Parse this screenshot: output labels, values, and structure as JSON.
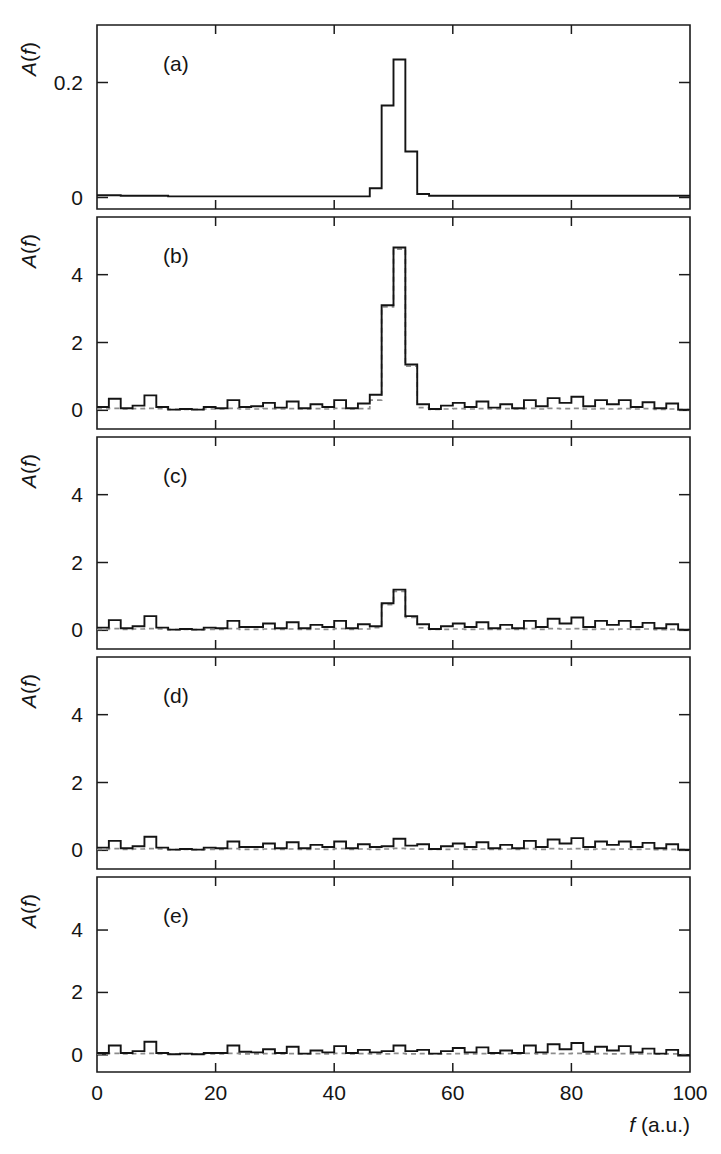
{
  "figure": {
    "xlabel_italic": "f",
    "xlabel_rest": " (a.u.)",
    "ylabel_italic": "A",
    "ylabel_rest": "(f)",
    "background_color": "#ffffff",
    "solid_color": "#141414",
    "dashed_color": "#8d8d8d"
  },
  "chart_data": [
    {
      "type": "line",
      "panel": "(a)",
      "title": "",
      "xlabel": "f (a.u.)",
      "ylabel": "A(f)",
      "xlim": [
        0,
        100
      ],
      "ylim": [
        -0.02,
        0.3
      ],
      "xticks": [
        0,
        20,
        40,
        60,
        80,
        100
      ],
      "yticks": [
        0,
        0.2
      ],
      "ytick_labels": [
        "0",
        "0.2"
      ],
      "grid": false,
      "legend": "none",
      "drawstyle": "steps-post",
      "bin_width": 2,
      "series": [
        {
          "name": "solid",
          "style": "solid",
          "x": [
            0,
            2,
            4,
            6,
            8,
            10,
            12,
            14,
            16,
            18,
            20,
            22,
            24,
            26,
            28,
            30,
            32,
            34,
            36,
            38,
            40,
            42,
            44,
            46,
            48,
            50,
            52,
            54,
            56,
            58,
            60,
            62,
            64,
            66,
            68,
            70,
            72,
            74,
            76,
            78,
            80,
            82,
            84,
            86,
            88,
            90,
            92,
            94,
            96,
            98,
            100
          ],
          "values": [
            0.004,
            0.004,
            0.003,
            0.003,
            0.003,
            0.003,
            0.002,
            0.002,
            0.002,
            0.002,
            0.002,
            0.002,
            0.002,
            0.002,
            0.002,
            0.002,
            0.002,
            0.002,
            0.002,
            0.002,
            0.002,
            0.002,
            0.002,
            0.016,
            0.16,
            0.24,
            0.08,
            0.006,
            0.003,
            0.003,
            0.003,
            0.003,
            0.003,
            0.003,
            0.003,
            0.003,
            0.003,
            0.003,
            0.003,
            0.003,
            0.003,
            0.003,
            0.003,
            0.003,
            0.003,
            0.003,
            0.003,
            0.003,
            0.003,
            0.003,
            0.003
          ]
        }
      ]
    },
    {
      "type": "line",
      "panel": "(b)",
      "title": "",
      "xlabel": "f (a.u.)",
      "ylabel": "A(f)",
      "xlim": [
        0,
        100
      ],
      "ylim": [
        -0.55,
        5.7
      ],
      "xticks": [
        0,
        20,
        40,
        60,
        80,
        100
      ],
      "yticks": [
        0,
        2,
        4
      ],
      "ytick_labels": [
        "0",
        "2",
        "4"
      ],
      "grid": false,
      "legend": "none",
      "drawstyle": "steps-post",
      "bin_width": 2,
      "series": [
        {
          "name": "solid",
          "style": "solid",
          "x": [
            0,
            2,
            4,
            6,
            8,
            10,
            12,
            14,
            16,
            18,
            20,
            22,
            24,
            26,
            28,
            30,
            32,
            34,
            36,
            38,
            40,
            42,
            44,
            46,
            48,
            50,
            52,
            54,
            56,
            58,
            60,
            62,
            64,
            66,
            68,
            70,
            72,
            74,
            76,
            78,
            80,
            82,
            84,
            86,
            88,
            90,
            92,
            94,
            96,
            98,
            100
          ],
          "values": [
            0.1,
            0.34,
            0.06,
            0.14,
            0.44,
            0.1,
            0.02,
            0.04,
            0.02,
            0.1,
            0.06,
            0.3,
            0.1,
            0.12,
            0.22,
            0.08,
            0.26,
            0.06,
            0.18,
            0.1,
            0.3,
            0.06,
            0.2,
            0.46,
            3.1,
            4.8,
            1.35,
            0.18,
            0.04,
            0.14,
            0.22,
            0.1,
            0.26,
            0.08,
            0.18,
            0.06,
            0.3,
            0.12,
            0.36,
            0.22,
            0.4,
            0.12,
            0.3,
            0.18,
            0.3,
            0.1,
            0.24,
            0.06,
            0.2,
            0.02,
            0.02
          ]
        },
        {
          "name": "dashed",
          "style": "dashed",
          "x": [
            0,
            2,
            4,
            6,
            8,
            10,
            12,
            14,
            16,
            18,
            20,
            22,
            24,
            26,
            28,
            30,
            32,
            34,
            36,
            38,
            40,
            42,
            44,
            46,
            48,
            50,
            52,
            54,
            56,
            58,
            60,
            62,
            64,
            66,
            68,
            70,
            72,
            74,
            76,
            78,
            80,
            82,
            84,
            86,
            88,
            90,
            92,
            94,
            96,
            98,
            100
          ],
          "values": [
            0.04,
            0.06,
            0.04,
            0.05,
            0.06,
            0.05,
            0.03,
            0.03,
            0.03,
            0.04,
            0.04,
            0.06,
            0.04,
            0.04,
            0.05,
            0.04,
            0.05,
            0.04,
            0.05,
            0.04,
            0.06,
            0.04,
            0.05,
            0.3,
            3.05,
            4.75,
            1.3,
            0.08,
            0.03,
            0.04,
            0.05,
            0.04,
            0.05,
            0.04,
            0.05,
            0.04,
            0.06,
            0.04,
            0.06,
            0.05,
            0.06,
            0.04,
            0.05,
            0.04,
            0.05,
            0.04,
            0.05,
            0.03,
            0.04,
            0.02,
            0.02
          ]
        }
      ]
    },
    {
      "type": "line",
      "panel": "(c)",
      "title": "",
      "xlabel": "f (a.u.)",
      "ylabel": "A(f)",
      "xlim": [
        0,
        100
      ],
      "ylim": [
        -0.55,
        5.7
      ],
      "xticks": [
        0,
        20,
        40,
        60,
        80,
        100
      ],
      "yticks": [
        0,
        2,
        4
      ],
      "ytick_labels": [
        "0",
        "2",
        "4"
      ],
      "grid": false,
      "legend": "none",
      "drawstyle": "steps-post",
      "bin_width": 2,
      "series": [
        {
          "name": "solid",
          "style": "solid",
          "x": [
            0,
            2,
            4,
            6,
            8,
            10,
            12,
            14,
            16,
            18,
            20,
            22,
            24,
            26,
            28,
            30,
            32,
            34,
            36,
            38,
            40,
            42,
            44,
            46,
            48,
            50,
            52,
            54,
            56,
            58,
            60,
            62,
            64,
            66,
            68,
            70,
            72,
            74,
            76,
            78,
            80,
            82,
            84,
            86,
            88,
            90,
            92,
            94,
            96,
            98,
            100
          ],
          "values": [
            0.08,
            0.3,
            0.06,
            0.12,
            0.42,
            0.08,
            0.02,
            0.04,
            0.02,
            0.08,
            0.06,
            0.28,
            0.1,
            0.1,
            0.2,
            0.06,
            0.24,
            0.06,
            0.16,
            0.1,
            0.28,
            0.06,
            0.18,
            0.12,
            0.8,
            1.2,
            0.42,
            0.18,
            0.04,
            0.12,
            0.2,
            0.1,
            0.24,
            0.06,
            0.16,
            0.06,
            0.28,
            0.1,
            0.34,
            0.2,
            0.38,
            0.1,
            0.28,
            0.16,
            0.28,
            0.1,
            0.22,
            0.06,
            0.18,
            0.02,
            0.02
          ]
        },
        {
          "name": "dashed",
          "style": "dashed",
          "x": [
            0,
            2,
            4,
            6,
            8,
            10,
            12,
            14,
            16,
            18,
            20,
            22,
            24,
            26,
            28,
            30,
            32,
            34,
            36,
            38,
            40,
            42,
            44,
            46,
            48,
            50,
            52,
            54,
            56,
            58,
            60,
            62,
            64,
            66,
            68,
            70,
            72,
            74,
            76,
            78,
            80,
            82,
            84,
            86,
            88,
            90,
            92,
            94,
            96,
            98,
            100
          ],
          "values": [
            0.03,
            0.05,
            0.03,
            0.04,
            0.05,
            0.04,
            0.02,
            0.03,
            0.02,
            0.03,
            0.03,
            0.05,
            0.03,
            0.03,
            0.04,
            0.03,
            0.04,
            0.03,
            0.04,
            0.03,
            0.05,
            0.03,
            0.04,
            0.08,
            0.76,
            1.15,
            0.38,
            0.07,
            0.03,
            0.03,
            0.04,
            0.03,
            0.04,
            0.03,
            0.04,
            0.03,
            0.05,
            0.03,
            0.05,
            0.04,
            0.05,
            0.03,
            0.04,
            0.03,
            0.04,
            0.03,
            0.04,
            0.02,
            0.03,
            0.02,
            0.02
          ]
        }
      ]
    },
    {
      "type": "line",
      "panel": "(d)",
      "title": "",
      "xlabel": "f (a.u.)",
      "ylabel": "A(f)",
      "xlim": [
        0,
        100
      ],
      "ylim": [
        -0.55,
        5.7
      ],
      "xticks": [
        0,
        20,
        40,
        60,
        80,
        100
      ],
      "yticks": [
        0,
        2,
        4
      ],
      "ytick_labels": [
        "0",
        "2",
        "4"
      ],
      "grid": false,
      "legend": "none",
      "drawstyle": "steps-post",
      "bin_width": 2,
      "series": [
        {
          "name": "solid",
          "style": "solid",
          "x": [
            0,
            2,
            4,
            6,
            8,
            10,
            12,
            14,
            16,
            18,
            20,
            22,
            24,
            26,
            28,
            30,
            32,
            34,
            36,
            38,
            40,
            42,
            44,
            46,
            48,
            50,
            52,
            54,
            56,
            58,
            60,
            62,
            64,
            66,
            68,
            70,
            72,
            74,
            76,
            78,
            80,
            82,
            84,
            86,
            88,
            90,
            92,
            94,
            96,
            98,
            100
          ],
          "values": [
            0.08,
            0.28,
            0.06,
            0.12,
            0.4,
            0.08,
            0.02,
            0.04,
            0.02,
            0.08,
            0.06,
            0.26,
            0.1,
            0.1,
            0.2,
            0.06,
            0.24,
            0.06,
            0.16,
            0.1,
            0.26,
            0.06,
            0.18,
            0.1,
            0.12,
            0.34,
            0.14,
            0.18,
            0.04,
            0.12,
            0.2,
            0.1,
            0.24,
            0.06,
            0.16,
            0.06,
            0.28,
            0.1,
            0.32,
            0.2,
            0.36,
            0.1,
            0.26,
            0.16,
            0.26,
            0.1,
            0.22,
            0.06,
            0.18,
            0.02,
            0.02
          ]
        },
        {
          "name": "dashed",
          "style": "dashed",
          "x": [
            0,
            2,
            4,
            6,
            8,
            10,
            12,
            14,
            16,
            18,
            20,
            22,
            24,
            26,
            28,
            30,
            32,
            34,
            36,
            38,
            40,
            42,
            44,
            46,
            48,
            50,
            52,
            54,
            56,
            58,
            60,
            62,
            64,
            66,
            68,
            70,
            72,
            74,
            76,
            78,
            80,
            82,
            84,
            86,
            88,
            90,
            92,
            94,
            96,
            98,
            100
          ],
          "values": [
            0.03,
            0.05,
            0.03,
            0.04,
            0.05,
            0.04,
            0.02,
            0.03,
            0.02,
            0.03,
            0.03,
            0.05,
            0.03,
            0.03,
            0.04,
            0.03,
            0.04,
            0.03,
            0.04,
            0.03,
            0.05,
            0.03,
            0.04,
            0.03,
            0.04,
            0.06,
            0.04,
            0.04,
            0.03,
            0.03,
            0.04,
            0.03,
            0.04,
            0.03,
            0.04,
            0.03,
            0.05,
            0.03,
            0.05,
            0.04,
            0.05,
            0.03,
            0.04,
            0.03,
            0.04,
            0.03,
            0.04,
            0.02,
            0.03,
            0.02,
            0.02
          ]
        }
      ]
    },
    {
      "type": "line",
      "panel": "(e)",
      "title": "",
      "xlabel": "f (a.u.)",
      "ylabel": "A(f)",
      "xlim": [
        0,
        100
      ],
      "ylim": [
        -0.55,
        5.7
      ],
      "xticks": [
        0,
        20,
        40,
        60,
        80,
        100
      ],
      "yticks": [
        0,
        2,
        4
      ],
      "ytick_labels": [
        "0",
        "2",
        "4"
      ],
      "grid": false,
      "legend": "none",
      "drawstyle": "steps-post",
      "bin_width": 2,
      "series": [
        {
          "name": "solid",
          "style": "solid",
          "x": [
            0,
            2,
            4,
            6,
            8,
            10,
            12,
            14,
            16,
            18,
            20,
            22,
            24,
            26,
            28,
            30,
            32,
            34,
            36,
            38,
            40,
            42,
            44,
            46,
            48,
            50,
            52,
            54,
            56,
            58,
            60,
            62,
            64,
            66,
            68,
            70,
            72,
            74,
            76,
            78,
            80,
            82,
            84,
            86,
            88,
            90,
            92,
            94,
            96,
            98,
            100
          ],
          "values": [
            0.06,
            0.3,
            0.06,
            0.12,
            0.42,
            0.06,
            0.02,
            0.04,
            0.02,
            0.06,
            0.06,
            0.3,
            0.1,
            0.08,
            0.18,
            0.06,
            0.26,
            0.04,
            0.14,
            0.08,
            0.28,
            0.06,
            0.16,
            0.08,
            0.12,
            0.3,
            0.12,
            0.16,
            0.04,
            0.12,
            0.22,
            0.08,
            0.24,
            0.06,
            0.14,
            0.06,
            0.3,
            0.08,
            0.34,
            0.18,
            0.38,
            0.1,
            0.26,
            0.14,
            0.28,
            0.08,
            0.2,
            0.04,
            0.16,
            -0.02,
            -0.02
          ]
        },
        {
          "name": "dashed",
          "style": "dashed",
          "x": [
            0,
            2,
            4,
            6,
            8,
            10,
            12,
            14,
            16,
            18,
            20,
            22,
            24,
            26,
            28,
            30,
            32,
            34,
            36,
            38,
            40,
            42,
            44,
            46,
            48,
            50,
            52,
            54,
            56,
            58,
            60,
            62,
            64,
            66,
            68,
            70,
            72,
            74,
            76,
            78,
            80,
            82,
            84,
            86,
            88,
            90,
            92,
            94,
            96,
            98,
            100
          ],
          "values": [
            0.03,
            0.05,
            0.03,
            0.04,
            0.05,
            0.03,
            0.02,
            0.03,
            0.02,
            0.03,
            0.03,
            0.05,
            0.03,
            0.03,
            0.04,
            0.03,
            0.04,
            0.03,
            0.04,
            0.03,
            0.05,
            0.03,
            0.04,
            0.03,
            0.03,
            0.05,
            0.03,
            0.04,
            0.03,
            0.03,
            0.04,
            0.03,
            0.04,
            0.03,
            0.04,
            0.03,
            0.05,
            0.03,
            0.05,
            0.04,
            0.05,
            0.03,
            0.04,
            0.03,
            0.04,
            0.03,
            0.04,
            0.02,
            0.03,
            0.01,
            0.01
          ]
        }
      ]
    }
  ]
}
